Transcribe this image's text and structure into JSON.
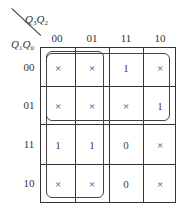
{
  "kmap": {
    "col_var": {
      "main": "Q",
      "s1": "3",
      "mid": "Q",
      "s2": "2"
    },
    "row_var": {
      "main": "Q",
      "s1": "1",
      "mid": "Q",
      "s2": "0"
    },
    "col_headers": [
      "00",
      "01",
      "11",
      "10"
    ],
    "row_headers": [
      "00",
      "01",
      "11",
      "10"
    ],
    "cells": [
      [
        "×",
        "×",
        "1",
        "×"
      ],
      [
        "×",
        "×",
        "×",
        "1"
      ],
      [
        "1",
        "1",
        "0",
        "×"
      ],
      [
        "×",
        "×",
        "0",
        "×"
      ]
    ],
    "groups": [
      {
        "name": "top-two-rows",
        "rows": [
          0,
          1
        ],
        "cols": [
          0,
          1,
          2,
          3
        ]
      },
      {
        "name": "left-two-columns",
        "rows": [
          0,
          1,
          2,
          3
        ],
        "cols": [
          0,
          1
        ]
      }
    ]
  }
}
